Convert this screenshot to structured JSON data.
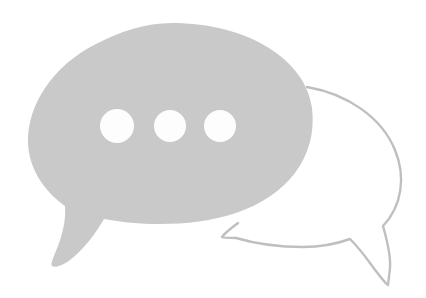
{
  "image": {
    "title": "Two overlapping speech bubbles",
    "description": "A large solid light-gray speech bubble with three white dots, overlapping an outlined speech bubble behind it on the right",
    "background_color": "#ffffff",
    "width": 426,
    "height": 298
  },
  "graphic": {
    "filled_bubble": {
      "name": "typing indicator speech bubble",
      "fill_color": "#c9c9c9",
      "tail_direction": "down-left",
      "bounds": {
        "x": 28,
        "y": 23,
        "width": 285,
        "height": 245
      },
      "path": "M 172 23 C 248 23 306 60 312 108 C 318 158 286 196 236 213 C 212 221 186 224 160 224 C 140 224 120 222 104 219 C 96 233 84 249 70 260 C 62 266 55 268 52 266 C 50 264 54 256 58 246 C 63 233 66 219 65 206 C 43 190 29 168 28 143 C 27 106 52 66 96 44 C 119 32 145 23 172 23 Z",
      "dots": [
        {
          "name": "dot-1",
          "cx": 117,
          "cy": 126,
          "r": 17,
          "color": "#fdfdfd"
        },
        {
          "name": "dot-2",
          "cx": 170,
          "cy": 126,
          "r": 16,
          "color": "#fdfdfd"
        },
        {
          "name": "dot-3",
          "cx": 220,
          "cy": 126,
          "r": 16,
          "color": "#fdfdfd"
        }
      ]
    },
    "outlined_bubble": {
      "name": "reply speech bubble",
      "stroke_color": "#bfbfbf",
      "stroke_width": 2.4,
      "fill": "none",
      "tail_direction": "down-right",
      "bounds": {
        "x": 222,
        "y": 85,
        "width": 180,
        "height": 202
      },
      "path": "M 307 87 C 348 94 382 118 395 150 C 406 177 402 206 383 226 C 387 240 391 255 390 268 C 389 278 388 284 388 285 C 385 283 378 274 370 263 C 362 252 355 244 350 239 C 336 244 320 247 303 247 C 278 247 253 243 236 238 C 229 238 224 238 222 237 C 224 234 230 229 238 223",
      "overlap_gap_path": "M 307 87 C 325 92 340 100 352 110"
    }
  },
  "colors": {
    "fill_gray": "#c9c9c9",
    "stroke_gray": "#bfbfbf",
    "dot_white": "#fdfdfd",
    "background": "#ffffff"
  }
}
